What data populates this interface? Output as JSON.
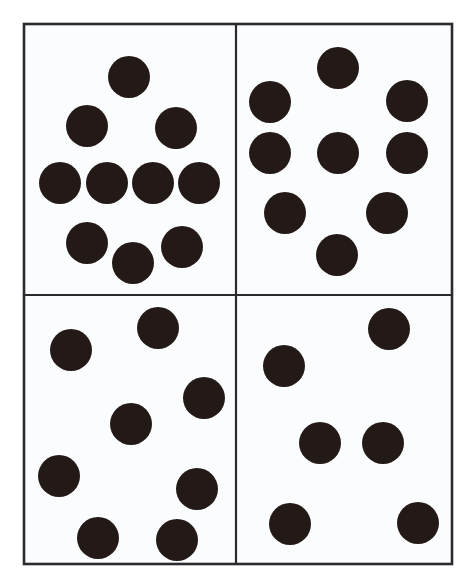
{
  "figure": {
    "kind": "dot-array-panel-grid",
    "width": 474,
    "height": 585,
    "background_color": "#ffffff"
  },
  "colors": {
    "dot_fill": "#231a18",
    "panel_background": "#fbfcfd",
    "border_stroke": "#2b2b2f",
    "page_background": "#ffffff"
  },
  "frame": {
    "x": 24,
    "y": 24,
    "width": 428,
    "height": 540,
    "stroke_width": 2.6,
    "vertical_divider_x": 236,
    "horizontal_divider_y": 295,
    "divider_stroke_width": 2.2
  },
  "dot_style": {
    "radius": 21,
    "radius_small": 20
  },
  "panels": [
    {
      "id": "top-left",
      "name": "panel-top-left",
      "position": "top-left",
      "bounds": {
        "x": 24,
        "y": 24,
        "width": 212,
        "height": 271
      },
      "dot_count": 10,
      "arrangement": "diamond / stacked rows (1-2-4-3)",
      "dots": [
        {
          "cx": 129,
          "cy": 77,
          "r": 21
        },
        {
          "cx": 87,
          "cy": 126,
          "r": 21
        },
        {
          "cx": 176,
          "cy": 128,
          "r": 21
        },
        {
          "cx": 60,
          "cy": 183,
          "r": 21
        },
        {
          "cx": 107,
          "cy": 183,
          "r": 21
        },
        {
          "cx": 153,
          "cy": 183,
          "r": 21
        },
        {
          "cx": 199,
          "cy": 183,
          "r": 21
        },
        {
          "cx": 87,
          "cy": 243,
          "r": 21
        },
        {
          "cx": 133,
          "cy": 263,
          "r": 21
        },
        {
          "cx": 182,
          "cy": 247,
          "r": 21
        }
      ]
    },
    {
      "id": "top-right",
      "name": "panel-top-right",
      "position": "top-right",
      "bounds": {
        "x": 236,
        "y": 24,
        "width": 216,
        "height": 271
      },
      "dot_count": 9,
      "arrangement": "three rows of three, lower row offset",
      "dots": [
        {
          "cx": 338,
          "cy": 68,
          "r": 21
        },
        {
          "cx": 270,
          "cy": 102,
          "r": 21
        },
        {
          "cx": 407,
          "cy": 101,
          "r": 21
        },
        {
          "cx": 270,
          "cy": 153,
          "r": 21
        },
        {
          "cx": 338,
          "cy": 153,
          "r": 21
        },
        {
          "cx": 407,
          "cy": 153,
          "r": 21
        },
        {
          "cx": 285,
          "cy": 213,
          "r": 21
        },
        {
          "cx": 387,
          "cy": 213,
          "r": 21
        },
        {
          "cx": 337,
          "cy": 255,
          "r": 21
        }
      ]
    },
    {
      "id": "bottom-left",
      "name": "panel-bottom-left",
      "position": "bottom-left",
      "bounds": {
        "x": 24,
        "y": 295,
        "width": 212,
        "height": 269
      },
      "dot_count": 8,
      "arrangement": "scattered / irregular",
      "dots": [
        {
          "cx": 158,
          "cy": 328,
          "r": 21
        },
        {
          "cx": 71,
          "cy": 350,
          "r": 21
        },
        {
          "cx": 204,
          "cy": 398,
          "r": 21
        },
        {
          "cx": 131,
          "cy": 424,
          "r": 21
        },
        {
          "cx": 59,
          "cy": 476,
          "r": 21
        },
        {
          "cx": 197,
          "cy": 489,
          "r": 21
        },
        {
          "cx": 98,
          "cy": 538,
          "r": 21
        },
        {
          "cx": 177,
          "cy": 540,
          "r": 21
        }
      ]
    },
    {
      "id": "bottom-right",
      "name": "panel-bottom-right",
      "position": "bottom-right",
      "bounds": {
        "x": 236,
        "y": 295,
        "width": 216,
        "height": 269
      },
      "dot_count": 6,
      "arrangement": "scattered / irregular",
      "dots": [
        {
          "cx": 389,
          "cy": 329,
          "r": 21
        },
        {
          "cx": 284,
          "cy": 366,
          "r": 21
        },
        {
          "cx": 320,
          "cy": 443,
          "r": 21
        },
        {
          "cx": 383,
          "cy": 443,
          "r": 21
        },
        {
          "cx": 290,
          "cy": 524,
          "r": 21
        },
        {
          "cx": 418,
          "cy": 523,
          "r": 21
        }
      ]
    }
  ],
  "totals": {
    "panel_count": 4,
    "dot_total": 33
  }
}
